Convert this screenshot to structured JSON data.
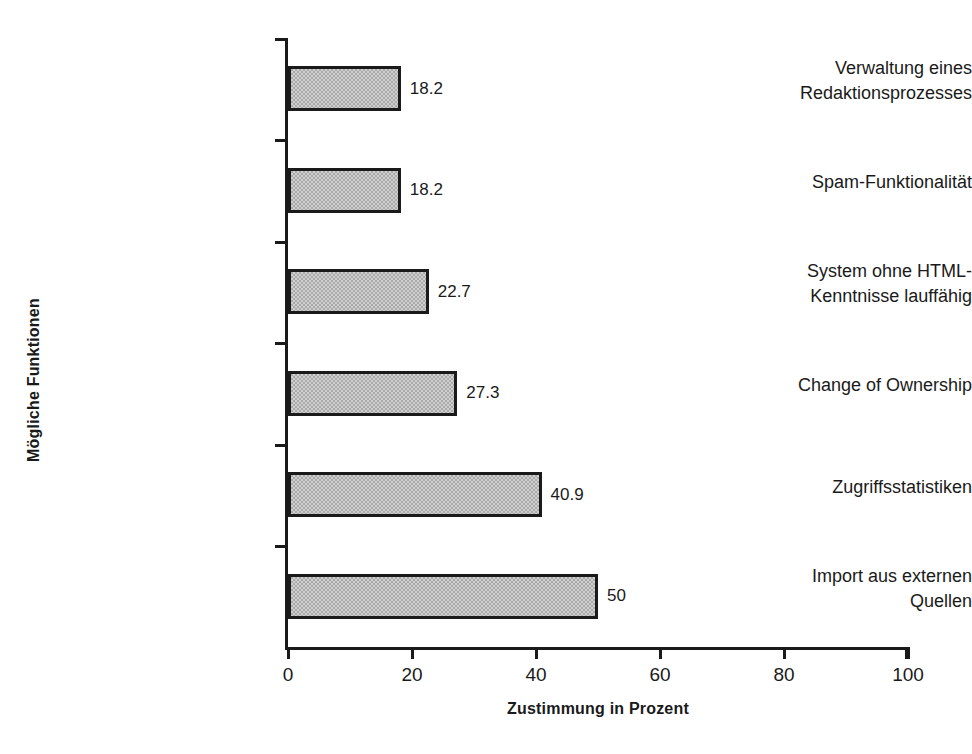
{
  "chart_data": {
    "type": "bar",
    "orientation": "horizontal",
    "title": "",
    "xlabel": "Zustimmung in Prozent",
    "ylabel": "Mögliche Funktionen",
    "categories": [
      "Verwaltung eines\nRedaktionsprozesses",
      "Spam-Funktionalität",
      "System ohne HTML-\nKenntnisse lauffähig",
      "Change of Ownership",
      "Zugriffsstatistiken",
      "Import aus externen\nQuellen"
    ],
    "values": [
      18.2,
      18.2,
      22.7,
      27.3,
      40.9,
      50
    ],
    "value_labels": [
      "18.2",
      "18.2",
      "22.7",
      "27.3",
      "40.9",
      "50"
    ],
    "xlim": [
      0,
      100
    ],
    "xticks": [
      0,
      20,
      40,
      60,
      80,
      100
    ],
    "xtick_labels": [
      "0",
      "20",
      "40",
      "60",
      "80",
      "100"
    ],
    "grid": false,
    "legend": null,
    "bar_fill_color": "#a9a9a9",
    "bar_border_color": "#1a1a1a",
    "background_color": "#ffffff",
    "text_color": "#1a1a1a"
  }
}
